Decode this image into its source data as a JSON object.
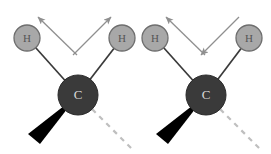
{
  "figure": {
    "title": "",
    "background_color": "#ffffff",
    "width": 271,
    "height": 154
  },
  "colors": {
    "hydrogen_fill": "#a8a8a8",
    "hydrogen_stroke": "#6e6e6e",
    "hydrogen_label": "#555555",
    "carbon_fill": "#3a3a3a",
    "carbon_stroke": "#2a2a2a",
    "carbon_label": "#d8d8d8",
    "bond_line": "#3a3a3a",
    "wedge_fill": "#000000",
    "dash_bond": "#bfbfbf",
    "arrow": "#8f8f8f"
  },
  "molecules": [
    {
      "name": "symmetric-stretch",
      "carbon": {
        "label": "C",
        "cx": 78,
        "cy": 95,
        "r": 20
      },
      "hydrogens": [
        {
          "label": "H",
          "cx": 27,
          "cy": 38,
          "r": 13,
          "position": "left"
        },
        {
          "label": "H",
          "cx": 122,
          "cy": 38,
          "r": 13,
          "position": "right"
        }
      ],
      "bonds": [
        {
          "type": "plain",
          "from": "carbon",
          "to": "hydrogen-left"
        },
        {
          "type": "plain",
          "from": "carbon",
          "to": "hydrogen-right"
        },
        {
          "type": "wedge",
          "from": "carbon",
          "to": "front-substituent",
          "direction": "down-left"
        },
        {
          "type": "dashed",
          "from": "carbon",
          "to": "back-substituent",
          "direction": "down-right"
        }
      ],
      "arrows": [
        {
          "name": "arrow-left",
          "direction": "up-left",
          "x1": 77,
          "y1": 55,
          "x2": 38,
          "y2": 17
        },
        {
          "name": "arrow-right",
          "direction": "up-right",
          "x1": 73,
          "y1": 55,
          "x2": 111,
          "y2": 17
        }
      ]
    },
    {
      "name": "asymmetric-stretch",
      "carbon": {
        "label": "C",
        "cx": 206,
        "cy": 95,
        "r": 20
      },
      "hydrogens": [
        {
          "label": "H",
          "cx": 155,
          "cy": 38,
          "r": 13,
          "position": "left"
        },
        {
          "label": "H",
          "cx": 249,
          "cy": 38,
          "r": 13,
          "position": "right"
        }
      ],
      "bonds": [
        {
          "type": "plain",
          "from": "carbon",
          "to": "hydrogen-left"
        },
        {
          "type": "plain",
          "from": "carbon",
          "to": "hydrogen-right"
        },
        {
          "type": "wedge",
          "from": "carbon",
          "to": "front-substituent",
          "direction": "down-left"
        },
        {
          "type": "dashed",
          "from": "carbon",
          "to": "back-substituent",
          "direction": "down-right"
        }
      ],
      "arrows": [
        {
          "name": "arrow-left",
          "direction": "up-left",
          "x1": 205,
          "y1": 55,
          "x2": 166,
          "y2": 17
        },
        {
          "name": "arrow-right",
          "direction": "down-left",
          "x1": 239,
          "y1": 17,
          "x2": 201,
          "y2": 55
        }
      ]
    }
  ]
}
